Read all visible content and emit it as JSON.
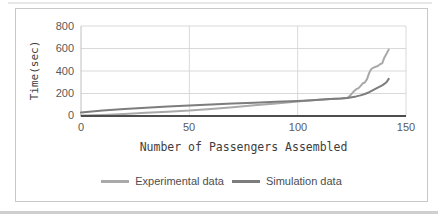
{
  "chart_data": {
    "type": "line",
    "title": "",
    "xlabel": "Number of Passengers Assembled",
    "ylabel": "Time(sec)",
    "xlim": [
      0,
      150
    ],
    "ylim": [
      0,
      800
    ],
    "xticks": [
      0,
      50,
      100,
      150
    ],
    "yticks": [
      0,
      200,
      400,
      600,
      800
    ],
    "xtick_labels": [
      "0",
      "50",
      "100",
      "150"
    ],
    "ytick_labels_top_to_bottom": [
      "800",
      "600",
      "400",
      "200",
      "0"
    ],
    "grid": true,
    "legend_position": "bottom",
    "series": [
      {
        "name": "Experimental data",
        "color": "#a9a9a9",
        "points": [
          [
            0,
            5
          ],
          [
            10,
            10
          ],
          [
            20,
            18
          ],
          [
            30,
            28
          ],
          [
            40,
            38
          ],
          [
            50,
            48
          ],
          [
            60,
            62
          ],
          [
            70,
            78
          ],
          [
            80,
            95
          ],
          [
            90,
            112
          ],
          [
            95,
            120
          ],
          [
            100,
            128
          ],
          [
            105,
            137
          ],
          [
            110,
            144
          ],
          [
            115,
            150
          ],
          [
            118,
            154
          ],
          [
            121,
            158
          ],
          [
            123,
            163
          ],
          [
            124,
            178
          ],
          [
            125,
            198
          ],
          [
            126,
            220
          ],
          [
            127,
            238
          ],
          [
            128,
            246
          ],
          [
            129,
            266
          ],
          [
            130,
            290
          ],
          [
            131,
            298
          ],
          [
            132,
            328
          ],
          [
            133,
            383
          ],
          [
            134,
            418
          ],
          [
            135,
            430
          ],
          [
            136,
            437
          ],
          [
            137,
            444
          ],
          [
            138,
            460
          ],
          [
            139,
            468
          ],
          [
            140,
            518
          ],
          [
            141,
            554
          ],
          [
            142,
            590
          ]
        ]
      },
      {
        "name": "Simulation data",
        "color": "#7d7d7d",
        "points": [
          [
            0,
            30
          ],
          [
            10,
            48
          ],
          [
            20,
            62
          ],
          [
            30,
            74
          ],
          [
            40,
            84
          ],
          [
            50,
            93
          ],
          [
            60,
            102
          ],
          [
            70,
            110
          ],
          [
            80,
            118
          ],
          [
            90,
            126
          ],
          [
            100,
            134
          ],
          [
            105,
            139
          ],
          [
            110,
            144
          ],
          [
            115,
            150
          ],
          [
            120,
            156
          ],
          [
            123,
            161
          ],
          [
            125,
            167
          ],
          [
            127,
            174
          ],
          [
            129,
            183
          ],
          [
            131,
            196
          ],
          [
            133,
            212
          ],
          [
            135,
            232
          ],
          [
            137,
            252
          ],
          [
            139,
            272
          ],
          [
            140,
            285
          ],
          [
            141,
            300
          ],
          [
            142,
            330
          ]
        ]
      }
    ]
  },
  "colors": {
    "background": "#ffffff",
    "frame_border": "#c9c9c9",
    "gridline": "#d9d9d9",
    "y_axis_line": "#bfbfbf",
    "x_axis_line": "#4d4d4d",
    "tick_text": "#595959",
    "axis_title_text": "#3d3d3d",
    "legend_text": "#4d4d4d"
  }
}
